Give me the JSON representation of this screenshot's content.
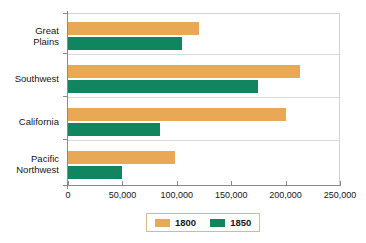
{
  "chart_data": {
    "type": "bar",
    "orientation": "horizontal",
    "title": "",
    "xlabel": "",
    "ylabel": "",
    "categories": [
      "Great Plains",
      "Southwest",
      "California",
      "Pacific Northwest"
    ],
    "category_lines": [
      [
        "Great",
        "Plains"
      ],
      [
        "Southwest"
      ],
      [
        "California"
      ],
      [
        "Pacific",
        "Northwest"
      ]
    ],
    "series": [
      {
        "name": "1800",
        "color": "#e9a856",
        "values": [
          120000,
          213000,
          200000,
          98000
        ]
      },
      {
        "name": "1850",
        "color": "#11855f",
        "values": [
          105000,
          175000,
          85000,
          50000
        ]
      }
    ],
    "xlim": [
      0,
      250000
    ],
    "xticks": [
      0,
      50000,
      100000,
      150000,
      200000,
      250000
    ],
    "xtick_labels": [
      "0",
      "50,000",
      "100,000",
      "150,000",
      "200,000",
      "250,000"
    ],
    "grid": true,
    "grid_axis": "y",
    "legend": {
      "position": "bottom",
      "entries": [
        {
          "label": "1800",
          "color": "#e9a856"
        },
        {
          "label": "1850",
          "color": "#11855f"
        }
      ]
    }
  },
  "colors": {
    "series_1800": "#e9a856",
    "series_1850": "#11855f",
    "axis": "#8a8a8a",
    "gridline": "#d9d9d9",
    "text": "#161616",
    "background": "#ffffff",
    "legend_border": "#d8b98a"
  }
}
